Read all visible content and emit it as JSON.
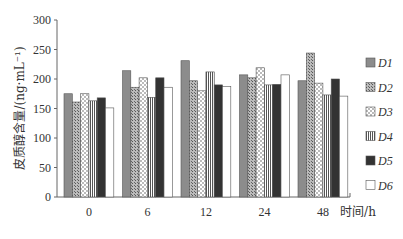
{
  "chart_data": {
    "type": "bar",
    "title": "",
    "xlabel": "时间/h",
    "ylabel": "皮质醇含量/(ng·mL⁻¹)",
    "ylim": [
      0,
      300
    ],
    "yticks": [
      0,
      50,
      100,
      150,
      200,
      250,
      300
    ],
    "categories": [
      "0",
      "6",
      "12",
      "24",
      "48"
    ],
    "grid": false,
    "legend_position": "right",
    "series": [
      {
        "name": "D1",
        "pattern": "solid-gray",
        "values": [
          175,
          214,
          231,
          207,
          197
        ]
      },
      {
        "name": "D2",
        "pattern": "fine-crosshatch",
        "values": [
          161,
          186,
          197,
          202,
          244
        ]
      },
      {
        "name": "D3",
        "pattern": "dotted",
        "values": [
          175,
          202,
          180,
          219,
          193
        ]
      },
      {
        "name": "D4",
        "pattern": "vertical-stripes",
        "values": [
          163,
          169,
          212,
          190,
          173
        ]
      },
      {
        "name": "D5",
        "pattern": "solid-dark",
        "values": [
          168,
          202,
          190,
          191,
          200
        ]
      },
      {
        "name": "D6",
        "pattern": "white",
        "values": [
          151,
          186,
          187,
          207,
          171
        ]
      }
    ]
  }
}
